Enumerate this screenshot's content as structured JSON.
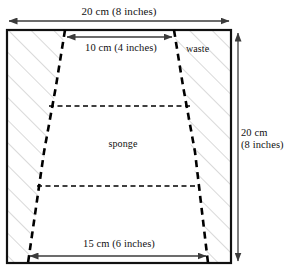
{
  "figure": {
    "type": "geometry-diagram",
    "labels": {
      "top_width": "20 cm (8 inches)",
      "inner_top_width": "10 cm (4 inches)",
      "bottom_width": "15 cm (6 inches)",
      "right_height_line1": "20 cm",
      "right_height_line2": "(8 inches)",
      "waste": "waste",
      "sponge": "sponge"
    },
    "colors": {
      "outline": "#111111",
      "dashed_cut": "#000000",
      "hatch": "#c9c9c9",
      "dimension_arrow": "#3b3b3b",
      "background": "#ffffff"
    },
    "measurements": {
      "outer_width_cm": 20,
      "outer_width_inches": 8,
      "outer_height_cm": 20,
      "outer_height_inches": 8,
      "trapezoid_top_cm": 10,
      "trapezoid_top_inches": 4,
      "trapezoid_bottom_cm": 15,
      "trapezoid_bottom_inches": 6
    }
  }
}
